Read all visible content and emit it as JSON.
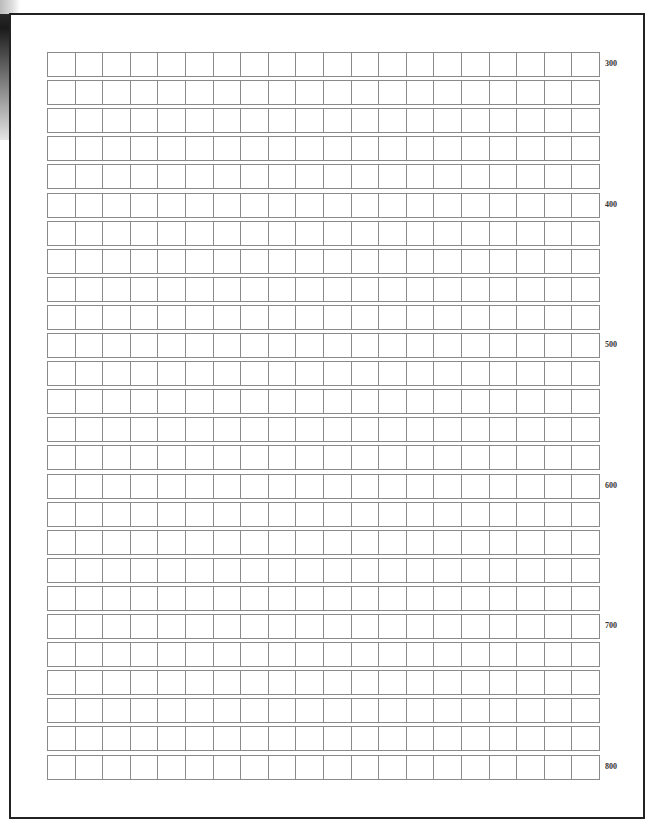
{
  "sheet": {
    "type": "grid-paper",
    "rows": 26,
    "columns": 20,
    "row_labels": [
      {
        "row_index": 0,
        "text": "300"
      },
      {
        "row_index": 5,
        "text": "400"
      },
      {
        "row_index": 10,
        "text": "500"
      },
      {
        "row_index": 15,
        "text": "600"
      },
      {
        "row_index": 20,
        "text": "700"
      },
      {
        "row_index": 25,
        "text": "800"
      }
    ]
  },
  "colors": {
    "frame": "#222222",
    "grid_line": "#8a8a8a",
    "label": "#333333",
    "background": "#ffffff"
  }
}
